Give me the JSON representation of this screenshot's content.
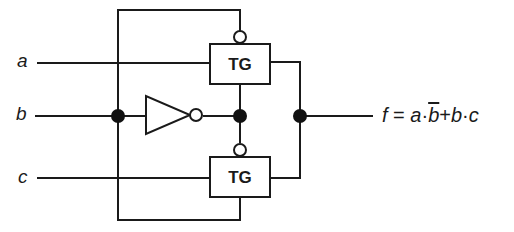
{
  "inputs": {
    "a": "a",
    "b": "b",
    "c": "c"
  },
  "gates": {
    "tg_top": "TG",
    "tg_bottom": "TG",
    "inverter": "NOT"
  },
  "output": {
    "lhs": "f",
    "equals": " = ",
    "term1_a": "a",
    "dot1": "·",
    "term1_b_bar": "b",
    "plus": "+",
    "term2_b": "b",
    "dot2": "·",
    "term2_c": "c"
  },
  "colors": {
    "line": "#1a1a1a",
    "background": "#ffffff"
  }
}
